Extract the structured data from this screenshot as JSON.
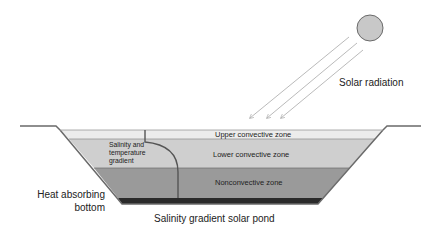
{
  "title": "Salinity gradient solar pond",
  "labels": {
    "solar_radiation": "Solar radiation",
    "upper_zone": "Upper convective zone",
    "lower_zone": "Lower convective zone",
    "nonconvective_zone": "Nonconvective zone",
    "gradient_line1": "Salinity and",
    "gradient_line2": "temperature",
    "gradient_line3": "gradient",
    "heat_line1": "Heat absorbing",
    "heat_line2": "bottom",
    "caption": "Salinity gradient solar pond"
  },
  "colors": {
    "upper_zone": "#ececec",
    "lower_zone": "#cfcfcf",
    "nonconvective_zone": "#9a9a9a",
    "bottom": "#2a2a2a",
    "outline": "#6a6a6a",
    "sun": "#c8c8c8",
    "rays": "#a8a8a8"
  }
}
